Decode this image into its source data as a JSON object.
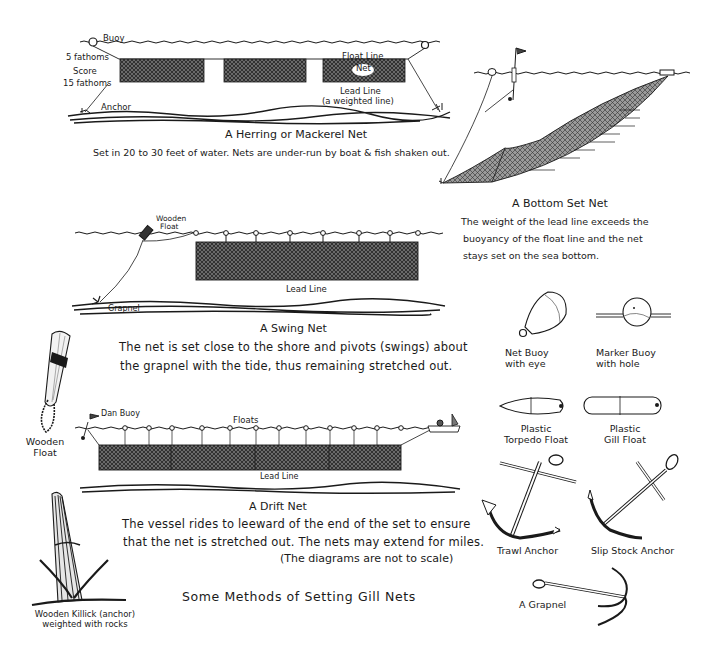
{
  "title": "Some Methods of Setting Gill Nets",
  "herring_net": {
    "labels": {
      "buoy": "Buoy",
      "five_fathoms": "5 fathoms",
      "score": "Score",
      "fifteen_fathoms": "15 fathoms",
      "anchor": "Anchor",
      "float_line": "Float Line",
      "net": "Net",
      "lead_line": "Lead Line",
      "lead_line_note": "(a weighted line)"
    },
    "caption": "A Herring or Mackerel Net",
    "description": "Set in 20 to 30 feet of water. Nets are under-run by boat & fish shaken out."
  },
  "bottom_set_net": {
    "caption": "A Bottom Set Net",
    "description_lines": [
      "The weight of the lead line exceeds the",
      "buoyancy of the float line and the net",
      "stays set on the sea bottom."
    ]
  },
  "swing_net": {
    "labels": {
      "wooden_float_1": "Wooden",
      "wooden_float_2": "Float",
      "lead_line": "Lead Line",
      "grapnel": "Grapnel"
    },
    "caption": "A Swing Net",
    "description_lines": [
      "The net is set close to the shore and pivots (swings) about",
      "the grapnel with the tide, thus remaining stretched out."
    ]
  },
  "drift_net": {
    "labels": {
      "dan_buoy": "Dan Buoy",
      "floats": "Floats",
      "lead_line": "Lead Line"
    },
    "caption": "A Drift Net",
    "description_lines": [
      "The vessel rides to leeward of the end of the set to ensure",
      "that the net is stretched out. The nets may extend for miles.",
      "(The diagrams are not to scale)"
    ]
  },
  "equipment": [
    {
      "id": "wooden-float",
      "lines": [
        "Wooden",
        "Float"
      ]
    },
    {
      "id": "net-buoy",
      "lines": [
        "Net Buoy",
        "with eye"
      ]
    },
    {
      "id": "marker-buoy",
      "lines": [
        "Marker Buoy",
        "with hole"
      ]
    },
    {
      "id": "plastic-torpedo-float",
      "lines": [
        "Plastic",
        "Torpedo Float"
      ]
    },
    {
      "id": "plastic-gill-float",
      "lines": [
        "Plastic",
        "Gill Float"
      ]
    },
    {
      "id": "trawl-anchor",
      "lines": [
        "Trawl Anchor"
      ]
    },
    {
      "id": "slip-stock-anchor",
      "lines": [
        "Slip Stock Anchor"
      ]
    },
    {
      "id": "grapnel",
      "lines": [
        "A Grapnel"
      ]
    },
    {
      "id": "wooden-killick",
      "lines": [
        "Wooden Killick (anchor)",
        "weighted with rocks"
      ]
    }
  ],
  "colors": {
    "ink": "#1a1a1a",
    "paper": "#ffffff",
    "net_fill": "#555555"
  }
}
